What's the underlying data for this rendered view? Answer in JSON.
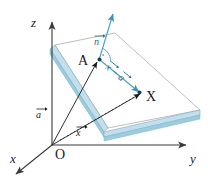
{
  "figure": {
    "colors": {
      "axis": "#4a4a4a",
      "plane_edge_outline": "#9a9a9a",
      "plane_band": "#bcdcea",
      "plane_band_dark": "#7ab4cc",
      "plane_fill": "#ffffff",
      "vector_blue": "#4a9cc0",
      "vector_dark": "#1a1a1a",
      "label_text": "#1a1a1a",
      "label_vector_text": "#2a6d8f"
    },
    "axes": [
      {
        "name": "x-axis",
        "label": "x"
      },
      {
        "name": "y-axis",
        "label": "y"
      },
      {
        "name": "z-axis",
        "label": "z"
      }
    ],
    "origin": {
      "label": "O"
    },
    "points": [
      {
        "name": "point-a",
        "label": "A"
      },
      {
        "name": "point-x",
        "label": "X"
      }
    ],
    "vectors": [
      {
        "name": "normal-vector",
        "label": "n",
        "accent": "arrow"
      },
      {
        "name": "position-vector-a",
        "label": "a",
        "accent": "arrow"
      },
      {
        "name": "position-vector-x",
        "label": "x",
        "accent": "arrow"
      },
      {
        "name": "difference-vector",
        "label_first": "x",
        "label_operator": "−",
        "label_second": "a",
        "accent": "arrow"
      }
    ],
    "markers": [
      {
        "name": "right-angle-marker",
        "label": ""
      }
    ]
  }
}
